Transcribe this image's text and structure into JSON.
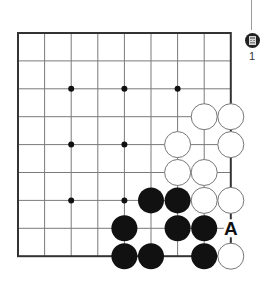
{
  "board": {
    "columns": 9,
    "rows": 9,
    "origin_x": 18,
    "origin_y": 33,
    "col_spacing": 26.6,
    "row_spacing": 27.9,
    "stone_radius": 13,
    "colors": {
      "background": "#ffffff",
      "grid_line": "#7a7a7a",
      "border": "#333333",
      "black_stone": "#111111",
      "white_stone_fill": "#ffffff",
      "white_stone_stroke": "#777777",
      "label": "#111111"
    },
    "star_points": [
      [
        2,
        2
      ],
      [
        4,
        2
      ],
      [
        6,
        2
      ],
      [
        2,
        4
      ],
      [
        4,
        4
      ],
      [
        2,
        6
      ],
      [
        4,
        6
      ]
    ],
    "white_stones": [
      [
        7,
        3
      ],
      [
        8,
        3
      ],
      [
        6,
        4
      ],
      [
        8,
        4
      ],
      [
        6,
        5
      ],
      [
        7,
        5
      ],
      [
        7,
        6
      ],
      [
        8,
        6
      ],
      [
        8,
        8
      ]
    ],
    "black_stones": [
      [
        5,
        6
      ],
      [
        6,
        6
      ],
      [
        4,
        7
      ],
      [
        6,
        7
      ],
      [
        7,
        7
      ],
      [
        4,
        8
      ],
      [
        5,
        8
      ],
      [
        7,
        8
      ]
    ],
    "labels": [
      {
        "col": 8,
        "row": 7,
        "text": "A"
      }
    ]
  },
  "marker": {
    "icon": "calculator-icon",
    "number": "1"
  }
}
